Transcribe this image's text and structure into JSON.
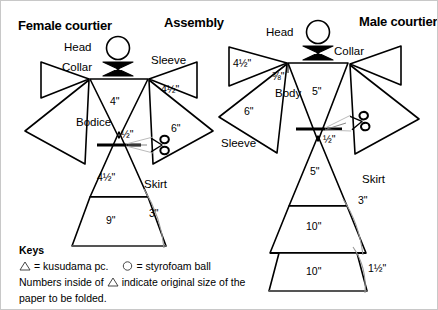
{
  "page": {
    "background": "#ffffff",
    "stroke": "#000000",
    "thin_stroke": "#555555",
    "border": "#c8c8c8",
    "width": 438,
    "height": 310
  },
  "titles": {
    "left": "Female courtier",
    "center": "Assembly",
    "right": "Male courtier"
  },
  "female": {
    "head_label": "Head",
    "collar_label": "Collar",
    "sleeve_label": "Sleeve",
    "bodice_label": "Bodice",
    "skirt_label": "Skirt",
    "bodice_size": "4\"",
    "sleeve_upper_size": "4½\"",
    "sleeve_lower_size": "6\"",
    "waist_size": "½\"",
    "skirt_upper_size": "4½\"",
    "skirt_lower_size": "9\"",
    "skirt_overlap": "3\""
  },
  "male": {
    "head_label": "Head",
    "collar_label": "Collar",
    "sleeve_label": "Sleeve",
    "body_label": "Body",
    "skirt_label": "Skirt",
    "body_size": "5\"",
    "sleeve_upper_size": "4½\"",
    "sleeve_lower_size": "6\"",
    "shoulder_size": "⅜\"",
    "waist_size": "½\"",
    "skirt_top_size": "5\"",
    "skirt_mid_size": "10\"",
    "skirt_bottom_size": "10\"",
    "skirt_overlap_upper": "3\"",
    "skirt_overlap_lower": "1½\""
  },
  "keys": {
    "heading": "Keys",
    "line1_a": "= kusudama pc.",
    "line1_b": "= styrofoam ball",
    "line2_pre": "Numbers inside of",
    "line2_post": "indicate original size of the",
    "line3": "paper to be folded.",
    "triangle_icon": "triangle-outline",
    "circle_icon": "circle-outline"
  },
  "icons": {
    "scissors": "scissors-icon",
    "head_circle": "circle-icon",
    "collar_bowtie": "bowtie-icon"
  }
}
